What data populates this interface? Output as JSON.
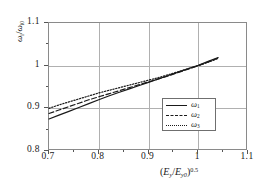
{
  "chart_data": {
    "type": "line",
    "title": "",
    "subtitle": "",
    "xlabel": "(E_y/E_y0)^0.5",
    "ylabel": "omega_i/omega_i0",
    "xlim": [
      0.7,
      1.1
    ],
    "ylim": [
      0.8,
      1.1
    ],
    "xticks": [
      "0.7",
      "0.8",
      "0.9",
      "1",
      "1.1"
    ],
    "xtick_values": [
      0.7,
      0.8,
      0.9,
      1.0,
      1.1
    ],
    "yticks": [
      "0.8",
      "0.9",
      "1",
      "1.1"
    ],
    "ytick_values": [
      0.8,
      0.9,
      1.0,
      1.1
    ],
    "grid": true,
    "legend_position": "center-right",
    "x": [
      0.7,
      0.72,
      0.74,
      0.76,
      0.78,
      0.8,
      0.82,
      0.84,
      0.86,
      0.88,
      0.9,
      0.92,
      0.94,
      0.96,
      0.98,
      1.0,
      1.02,
      1.04
    ],
    "series": [
      {
        "name": "omega_1",
        "label": "ω",
        "sub": "1",
        "style": "solid",
        "color": "#1a1a1a",
        "values": [
          0.875,
          0.884,
          0.893,
          0.902,
          0.911,
          0.92,
          0.929,
          0.937,
          0.945,
          0.953,
          0.961,
          0.969,
          0.977,
          0.985,
          0.993,
          1.001,
          1.01,
          1.019
        ]
      },
      {
        "name": "omega_2",
        "label": "ω",
        "sub": "2",
        "style": "dashed",
        "color": "#1a1a1a",
        "values": [
          0.888,
          0.896,
          0.904,
          0.912,
          0.92,
          0.927,
          0.934,
          0.941,
          0.948,
          0.955,
          0.962,
          0.969,
          0.976,
          0.984,
          0.992,
          1.0,
          1.009,
          1.018
        ]
      },
      {
        "name": "omega_3",
        "label": "ω",
        "sub": "3",
        "style": "dotted",
        "color": "#1a1a1a",
        "values": [
          0.9,
          0.908,
          0.915,
          0.922,
          0.929,
          0.936,
          0.942,
          0.948,
          0.954,
          0.96,
          0.966,
          0.972,
          0.979,
          0.986,
          0.993,
          1.0,
          1.008,
          1.017
        ]
      }
    ]
  },
  "axes": {
    "x_title_parts": {
      "open": "(",
      "e_y": "E",
      "sub_y": "y",
      "slash": "/",
      "e_y0": "E",
      "sub_y0": "y0",
      "close": ")",
      "exponent": "0.5"
    },
    "y_title_parts": {
      "omega": "ω",
      "sub_i": "i",
      "slash": "/",
      "omega0": "ω",
      "sub_i0": "i0"
    }
  },
  "legend": {
    "entries": [
      {
        "symbol": "ω",
        "subscript": "1",
        "style": "solid"
      },
      {
        "symbol": "ω",
        "subscript": "2",
        "style": "dashed"
      },
      {
        "symbol": "ω",
        "subscript": "3",
        "style": "dotted"
      }
    ]
  }
}
